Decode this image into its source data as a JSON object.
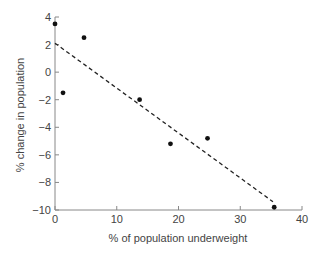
{
  "chart_data": {
    "type": "scatter",
    "title": "",
    "xlabel": "% of population underweight",
    "ylabel": "% change in population",
    "xlim": [
      0,
      40
    ],
    "ylim": [
      -10,
      4
    ],
    "xticks": [
      0,
      10,
      20,
      30,
      40
    ],
    "yticks": [
      4,
      2,
      0,
      -2,
      -4,
      -6,
      -8,
      -10
    ],
    "xtick_labels": [
      "0",
      "10",
      "20",
      "30",
      "40"
    ],
    "ytick_labels": [
      "4",
      "2",
      "0",
      "−2",
      "−4",
      "−6",
      "−8",
      "−10"
    ],
    "grid": false,
    "legend": null,
    "series": [
      {
        "name": "countries",
        "type": "scatter",
        "points": [
          {
            "x": 0,
            "y": 3.5
          },
          {
            "x": 1.3,
            "y": -1.5
          },
          {
            "x": 4.7,
            "y": 2.5
          },
          {
            "x": 13.7,
            "y": -2.0
          },
          {
            "x": 18.7,
            "y": -5.2
          },
          {
            "x": 24.7,
            "y": -4.8
          },
          {
            "x": 35.5,
            "y": -9.8
          }
        ]
      },
      {
        "name": "trend line",
        "type": "line",
        "style": "dashed",
        "points": [
          {
            "x": 0,
            "y": 2.1
          },
          {
            "x": 35.3,
            "y": -9.4
          }
        ]
      }
    ]
  }
}
